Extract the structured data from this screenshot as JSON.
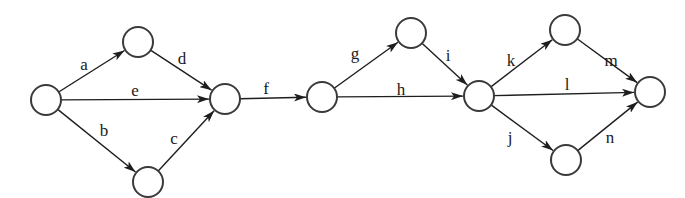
{
  "diagram": {
    "type": "activity-on-arrow network",
    "colors": {
      "node_stroke": "#3a3a3a",
      "edge": "#1e1e1e",
      "label": "#1a1a1a",
      "background": "#ffffff"
    },
    "nodes": [
      {
        "id": "n1",
        "cx": 46,
        "cy": 100,
        "r": 15
      },
      {
        "id": "n2",
        "cx": 138,
        "cy": 42,
        "r": 15
      },
      {
        "id": "n3",
        "cx": 148,
        "cy": 182,
        "r": 15
      },
      {
        "id": "n4",
        "cx": 225,
        "cy": 99,
        "r": 15
      },
      {
        "id": "n5",
        "cx": 322,
        "cy": 97,
        "r": 15
      },
      {
        "id": "n6",
        "cx": 411,
        "cy": 33,
        "r": 15
      },
      {
        "id": "n7",
        "cx": 479,
        "cy": 96,
        "r": 15
      },
      {
        "id": "n8",
        "cx": 565,
        "cy": 30,
        "r": 15
      },
      {
        "id": "n9",
        "cx": 566,
        "cy": 160,
        "r": 15
      },
      {
        "id": "n10",
        "cx": 650,
        "cy": 92,
        "r": 15
      }
    ],
    "edges": [
      {
        "label": "a",
        "from": "n1",
        "to": "n2",
        "lx": 84,
        "ly": 70
      },
      {
        "label": "e",
        "from": "n1",
        "to": "n4",
        "lx": 135,
        "ly": 96
      },
      {
        "label": "b",
        "from": "n1",
        "to": "n3",
        "lx": 104,
        "ly": 136
      },
      {
        "label": "d",
        "from": "n2",
        "to": "n4",
        "lx": 182,
        "ly": 64
      },
      {
        "label": "c",
        "from": "n3",
        "to": "n4",
        "lx": 174,
        "ly": 144
      },
      {
        "label": "f",
        "from": "n4",
        "to": "n5",
        "lx": 266,
        "ly": 94
      },
      {
        "label": "g",
        "from": "n5",
        "to": "n6",
        "lx": 355,
        "ly": 59
      },
      {
        "label": "h",
        "from": "n5",
        "to": "n7",
        "lx": 401,
        "ly": 95
      },
      {
        "label": "i",
        "from": "n6",
        "to": "n7",
        "lx": 448,
        "ly": 61
      },
      {
        "label": "k",
        "from": "n7",
        "to": "n8",
        "lx": 511,
        "ly": 66
      },
      {
        "label": "l",
        "from": "n7",
        "to": "n10",
        "lx": 567,
        "ly": 90
      },
      {
        "label": "j",
        "from": "n7",
        "to": "n9",
        "lx": 510,
        "ly": 143
      },
      {
        "label": "m",
        "from": "n8",
        "to": "n10",
        "lx": 611,
        "ly": 66
      },
      {
        "label": "n",
        "from": "n9",
        "to": "n10",
        "lx": 610,
        "ly": 143
      }
    ]
  }
}
